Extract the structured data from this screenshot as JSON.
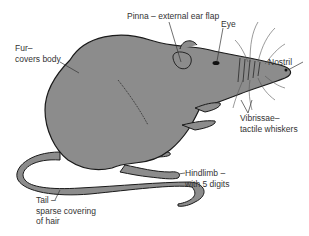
{
  "diagram": {
    "colors": {
      "body": "#8c8c8c",
      "outline": "#1a1a1a",
      "text": "#333333",
      "leader": "#333333",
      "background": "#ffffff"
    },
    "labels": {
      "pinna": {
        "line1": "Pinna – external ear flap"
      },
      "eye": {
        "line1": "Eye"
      },
      "nostril": {
        "line1": "Nostril"
      },
      "fur": {
        "line1": "Fur–",
        "line2": "covers body"
      },
      "vibrissae": {
        "line1": "Vibrissae–",
        "line2": "tactile whiskers"
      },
      "hindlimb": {
        "line1": "Hindlimb –",
        "line2": "with 5 digits"
      },
      "tail": {
        "line1": "Tail –",
        "line2": "sparse covering",
        "line3": "of hair"
      }
    }
  }
}
